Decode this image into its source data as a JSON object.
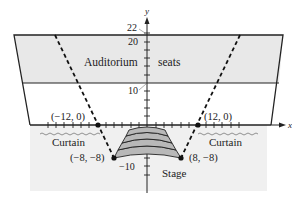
{
  "diagram": {
    "axes": {
      "x_label": "x",
      "y_label": "y",
      "y_ticks": {
        "top": "22",
        "twenty": "20",
        "ten": "10",
        "neg_ten": "−10"
      }
    },
    "labels": {
      "auditorium": "Auditorium",
      "seats": "seats",
      "curtain_left": "Curtain",
      "curtain_right": "Curtain",
      "stage": "Stage"
    },
    "points": [
      {
        "name": "left-axis-point",
        "label": "(−12, 0)",
        "x": -12,
        "y": 0
      },
      {
        "name": "right-axis-point",
        "label": "(12, 0)",
        "x": 12,
        "y": 0
      },
      {
        "name": "left-stage-point",
        "label": "(−8, −8)",
        "x": -8,
        "y": -8
      },
      {
        "name": "right-stage-point",
        "label": "(8, −8)",
        "x": 8,
        "y": -8
      }
    ],
    "colors": {
      "seat_band": "#e8e8e8",
      "stage_area": "#f0f0f0",
      "stage_steps": "#b8b8b8",
      "lines": "#222222"
    }
  }
}
